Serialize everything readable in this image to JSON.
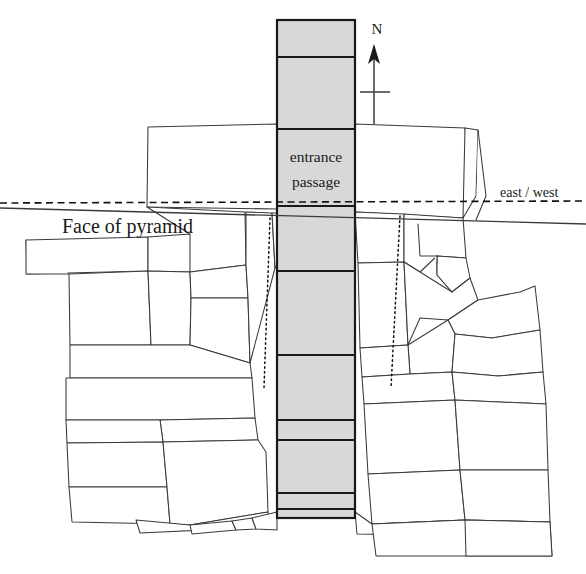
{
  "figure": {
    "width": 586,
    "height": 574,
    "background_color": "#ffffff",
    "line_color": "#3a3a3a",
    "shaft_fill_color": "#d8d8d8",
    "shaft_stroke_color": "#1a1a1a"
  },
  "labels": {
    "entrance_line1": "entrance",
    "entrance_line2": "passage",
    "face_of_pyramid": "Face of pyramid",
    "east_west": "east / west",
    "north": "N"
  },
  "compass": {
    "label": "N",
    "label_x": 377,
    "label_y": 34,
    "shaft_x": 374,
    "shaft_top": 46,
    "shaft_bottom": 124,
    "head_points": "374,44 368,64 374,59 380,64",
    "tick_y": 92,
    "tick_x1": 360,
    "tick_x2": 390
  },
  "axes": {
    "dashed_east_west": {
      "x1": 0,
      "y1": 203,
      "x2": 586,
      "y2": 201
    },
    "solid_face_line": {
      "x1": 0,
      "y1": 208,
      "x2": 586,
      "y2": 224
    },
    "east_west_label_x": 500,
    "east_west_label_y": 197,
    "face_label_x": 62,
    "face_label_y": 233
  },
  "passage": {
    "x_left": 277,
    "x_right": 355,
    "y_top": 20,
    "y_bottom": 518,
    "fill": "#d8d8d8",
    "dividers": [
      57,
      129,
      206,
      271,
      355,
      420,
      440,
      493,
      509
    ],
    "label_x": 316,
    "label_y1": 162,
    "label_y2": 187
  },
  "guides": {
    "left_dotted": {
      "x1": 270,
      "y1": 218,
      "x2": 264,
      "y2": 388
    },
    "right_dotted": {
      "x1": 400,
      "y1": 216,
      "x2": 391,
      "y2": 388
    }
  },
  "masonry_blocks": [
    {
      "name": "lintel-block-left",
      "points": "148,127 277,124 277,209 147,207"
    },
    {
      "name": "lintel-block-right",
      "points": "355,124 465,128 470,196 463,218 355,212"
    },
    {
      "name": "upper-right-edge-block",
      "points": "465,128 478,130 476,196 463,218"
    },
    {
      "name": "left-slab-upper",
      "points": "26,240 148,237 148,271 27,274"
    },
    {
      "name": "left-slab-top-strip",
      "points": "148,237 190,234 200,240 190,272 148,271"
    },
    {
      "name": "left-block-face-upper",
      "points": "147,207 245,212 246,265 190,272 190,234"
    },
    {
      "name": "left-mid-block-a",
      "points": "69,274 148,271 151,345 70,345"
    },
    {
      "name": "left-mid-block-b",
      "points": "148,271 190,272 191,298 190,345 151,345"
    },
    {
      "name": "left-mid-block-c",
      "points": "190,272 246,265 248,298 191,298"
    },
    {
      "name": "left-mid-block-d",
      "points": "191,298 248,298 250,363 190,345"
    },
    {
      "name": "face-column-block",
      "points": "246,212 272,213 275,268 250,363 248,298 246,265"
    },
    {
      "name": "near-shaft-block-upper",
      "points": "272,213 277,213 277,265 275,268"
    },
    {
      "name": "left-wide-slab",
      "points": "70,345 151,345 190,345 250,363 252,378 70,378"
    },
    {
      "name": "left-row-block-a",
      "points": "66,378 252,378 255,418 160,420 66,420"
    },
    {
      "name": "left-row-block-b",
      "points": "160,420 255,418 258,440 163,442"
    },
    {
      "name": "left-row-block-c",
      "points": "66,420 160,420 163,442 67,443"
    },
    {
      "name": "left-low-block-a",
      "points": "67,443 163,442 167,487 69,487"
    },
    {
      "name": "left-low-block-b",
      "points": "69,487 167,487 170,524 72,522"
    },
    {
      "name": "center-low-big-block",
      "points": "163,442 258,440 266,452 268,512 190,525 170,524 167,487"
    },
    {
      "name": "bottom-wedge-left",
      "points": "136,520 190,525 268,512 270,527 140,533"
    },
    {
      "name": "bottom-wedge-a",
      "points": "190,525 232,521 236,530 192,534"
    },
    {
      "name": "bottom-wedge-b",
      "points": "232,521 252,518 256,529 236,530"
    },
    {
      "name": "bottom-wedge-c",
      "points": "252,518 277,512 277,530 256,529"
    },
    {
      "name": "right-upper-block-a",
      "points": "355,212 404,214 404,262 358,263"
    },
    {
      "name": "right-upper-block-b",
      "points": "404,214 463,218 466,258 437,256 420,272 404,262"
    },
    {
      "name": "right-notch-block",
      "points": "437,256 466,258 470,278 452,292 437,275"
    },
    {
      "name": "right-mid-block-a",
      "points": "358,263 404,262 408,345 360,348"
    },
    {
      "name": "right-mid-block-b",
      "points": "404,262 420,272 452,292 470,278 478,300 448,320 420,318 408,345"
    },
    {
      "name": "right-pent-block",
      "points": "448,320 478,300 520,292 535,286 540,330 492,338 455,334"
    },
    {
      "name": "right-block-small",
      "points": "408,345 448,320 455,334 452,372 410,374"
    },
    {
      "name": "right-block-upper-right",
      "points": "455,334 492,338 540,330 543,372 498,376 452,372"
    },
    {
      "name": "right-strip-a",
      "points": "360,348 408,345 410,374 362,377"
    },
    {
      "name": "right-strip-b",
      "points": "362,377 410,374 452,372 455,400 364,404"
    },
    {
      "name": "right-strip-c",
      "points": "452,372 498,376 543,372 546,404 455,400"
    },
    {
      "name": "right-low-block-a",
      "points": "364,404 455,400 460,470 368,474"
    },
    {
      "name": "right-low-block-b",
      "points": "455,400 546,404 548,470 460,470"
    },
    {
      "name": "right-low-block-c",
      "points": "368,474 460,470 465,520 372,524"
    },
    {
      "name": "right-low-block-d",
      "points": "460,470 548,470 550,522 465,520"
    },
    {
      "name": "right-bottom-wedge",
      "points": "355,512 372,524 465,520 466,536 357,534"
    },
    {
      "name": "right-foot-block",
      "points": "372,524 465,520 550,522 552,556 376,556"
    },
    {
      "name": "right-foot-block-b",
      "points": "465,520 550,522 552,556 466,556"
    }
  ],
  "loose_strokes": [
    {
      "name": "face-line-left-extension",
      "points": "26,240 26,274 69,274"
    },
    {
      "name": "right-v-notch",
      "points": "418,224 420,256 437,256 437,275 452,292"
    },
    {
      "name": "right-edge-tail",
      "points": "478,130 486,196 476,220"
    }
  ]
}
